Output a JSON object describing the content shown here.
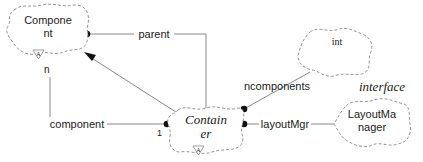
{
  "diagram": {
    "type": "Booch class diagram",
    "classes": [
      {
        "id": "component",
        "label_line1": "Compone",
        "label_line2": "nt",
        "abstract_adornment": "A",
        "style": "sans"
      },
      {
        "id": "container",
        "label_line1": "Contain",
        "label_line2": "er",
        "abstract_adornment": "A",
        "style": "serif-italic"
      },
      {
        "id": "int",
        "label_line1": "int",
        "style": "serif"
      },
      {
        "id": "layoutmanager",
        "label_line1": "LayoutMa",
        "label_line2": "nager",
        "stereotype": "interface",
        "style": "sans"
      }
    ],
    "relationships": [
      {
        "id": "parent",
        "label": "parent",
        "from": "container",
        "to": "component",
        "kind": "has"
      },
      {
        "id": "component-rel",
        "label": "component",
        "from": "container",
        "to": "component",
        "kind": "has",
        "multiplicity_source": "1",
        "multiplicity_target": "n"
      },
      {
        "id": "inheritance",
        "from": "container",
        "to": "component",
        "kind": "inherits"
      },
      {
        "id": "ncomponents",
        "label": "ncomponents",
        "from": "container",
        "to": "int",
        "kind": "has"
      },
      {
        "id": "layoutMgr",
        "label": "layoutMgr",
        "from": "container",
        "to": "layoutmanager",
        "kind": "has"
      }
    ],
    "multiplicities": {
      "n": "n",
      "one": "1"
    },
    "stereotype_label": "interface"
  }
}
